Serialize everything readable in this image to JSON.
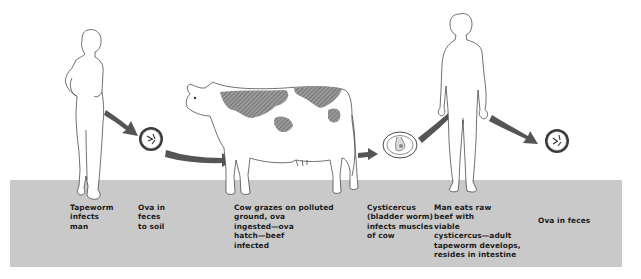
{
  "diagram": {
    "type": "life-cycle",
    "colors": {
      "ground": "#c9c9c9",
      "arrow": "#555555",
      "outline": "#333333",
      "cow_spots": "#7a7a7a",
      "text": "#1a1a1a"
    },
    "stages": [
      {
        "id": "man-infected",
        "label": "Tapeworm\ninfects\nman",
        "figure": "human-figure"
      },
      {
        "id": "ova-soil",
        "label": "Ova in\nfeces\nto soil",
        "figure": "ovum-icon"
      },
      {
        "id": "cow",
        "label": "Cow grazes on polluted\nground, ova\ningested—ova\nhatch—beef\ninfected",
        "figure": "cow-figure"
      },
      {
        "id": "cysticercus",
        "label": "Cysticercus\n(bladder worm)\ninfects muscles\nof cow",
        "figure": "cysticercus-icon"
      },
      {
        "id": "man-eats",
        "label": "Man eats raw\nbeef with\nviable\ncysticercus—adult\ntapeworm develops,\nresides in intestine",
        "figure": "human-figure"
      },
      {
        "id": "ova-feces",
        "label": "Ova in feces",
        "figure": "ovum-icon"
      }
    ],
    "arrows": [
      {
        "from": "man-infected",
        "to": "ova-soil"
      },
      {
        "from": "ova-soil",
        "to": "cow"
      },
      {
        "from": "cow",
        "to": "cysticercus"
      },
      {
        "from": "cysticercus",
        "to": "man-eats"
      },
      {
        "from": "man-eats",
        "to": "ova-feces"
      }
    ]
  }
}
